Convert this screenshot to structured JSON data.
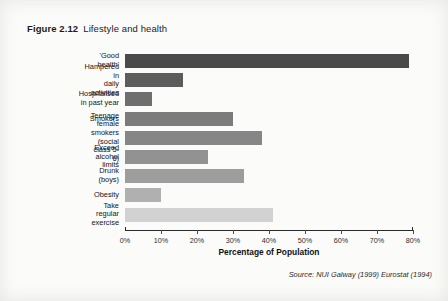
{
  "figure": {
    "number": "Figure 2.12",
    "caption": "Lifestyle and health"
  },
  "source_note": "Source: NUI Galway (1999) Eurostat (1994)",
  "chart_data": {
    "type": "bar",
    "orientation": "horizontal",
    "title": "Lifestyle and health",
    "xlabel": "Percentage of Population",
    "ylabel": "",
    "xlim": [
      0,
      80
    ],
    "grid": false,
    "legend": null,
    "xticks": [
      "0%",
      "10%",
      "20%",
      "30%",
      "40%",
      "50%",
      "60%",
      "70%",
      "80%"
    ],
    "xtick_values": [
      0,
      10,
      20,
      30,
      40,
      50,
      60,
      70,
      80
    ],
    "categories": [
      "'Good health'",
      "Hampered in\ndaily activities",
      "Hospitalised\nin past year",
      "Smokers",
      "Teenage female smokers\n(social class 5-6)",
      "Exceed alcohol limits",
      "Drunk (boys)",
      "Obesity",
      "Take regular exercise"
    ],
    "values": [
      79,
      16,
      7.5,
      30,
      38,
      23,
      33,
      10,
      41
    ],
    "bar_colors": [
      "#4a4a4a",
      "#5c5c5c",
      "#6e6e6e",
      "#7b7b7b",
      "#868686",
      "#929292",
      "#9d9d9d",
      "#b0b0b0",
      "#d2d2d2"
    ]
  }
}
